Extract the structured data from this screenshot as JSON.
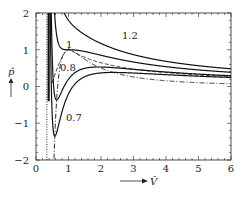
{
  "chart_data": {
    "type": "line",
    "title": "",
    "xlabel": "V̂",
    "ylabel": "p̂",
    "xlim": [
      0,
      6
    ],
    "ylim": [
      -2,
      2
    ],
    "xticks": [
      0,
      1,
      2,
      3,
      4,
      5,
      6
    ],
    "yticks": [
      -2,
      -1,
      0,
      1,
      2
    ],
    "grid": false,
    "legend": "none (inline curve labels)",
    "series": [
      {
        "name": "1.2",
        "style": "solid",
        "kind": "isotherm",
        "T": 1.2,
        "x": [
          0.45,
          0.5,
          0.6,
          0.8,
          1.0,
          1.5,
          2.0,
          3.0,
          4.0,
          5.0,
          6.0
        ],
        "y": [
          5.5,
          3.6,
          2.06,
          1.46,
          1.05,
          0.95,
          0.63,
          0.58,
          0.49,
          0.43,
          0.45
        ]
      },
      {
        "name": "1",
        "style": "solid",
        "kind": "isotherm",
        "T": 1.0,
        "x": [
          0.5,
          0.6,
          0.8,
          1.0,
          1.5,
          2.0,
          3.0,
          4.0,
          5.0,
          6.0
        ],
        "y": [
          4.0,
          1.85,
          1.01,
          1.0,
          0.9,
          0.85,
          0.66,
          0.54,
          0.46,
          0.37
        ]
      },
      {
        "name": "0.8",
        "style": "solid",
        "kind": "isotherm",
        "T": 0.8,
        "x": [
          0.45,
          0.5,
          0.6,
          0.8,
          1.0,
          1.5,
          2.0,
          3.0,
          4.0,
          5.0,
          6.0
        ],
        "y": [
          1.2,
          0.27,
          -0.33,
          0.33,
          0.55,
          0.6,
          0.53,
          0.43,
          0.34,
          0.29,
          0.24
        ]
      },
      {
        "name": "0.7",
        "style": "solid",
        "kind": "isotherm",
        "T": 0.7,
        "x": [
          0.45,
          0.5,
          0.55,
          0.6,
          0.8,
          1.0,
          1.5,
          2.0,
          3.0,
          4.0,
          5.0,
          6.0
        ],
        "y": [
          0.6,
          -0.8,
          -1.3,
          -1.1,
          0.08,
          0.35,
          0.46,
          0.45,
          0.38,
          0.31,
          0.26,
          0.22
        ]
      },
      {
        "name": "spinodal",
        "style": "dash-dot",
        "kind": "spinodal",
        "x": [
          0.55,
          0.6,
          0.7,
          0.8,
          1.0
        ],
        "y": [
          -1.5,
          -0.8,
          0.3,
          0.7,
          1.0
        ]
      },
      {
        "name": "dashed",
        "style": "dashed",
        "kind": "coexistence",
        "x": [
          0.5,
          0.6,
          0.8,
          1.0,
          1.5,
          2.0,
          3.0,
          4.0,
          5.0,
          6.0
        ],
        "y": [
          0.3,
          0.6,
          0.85,
          1.0,
          0.75,
          0.62,
          0.48,
          0.4,
          0.34,
          0.29
        ]
      },
      {
        "name": "dash-dot-right",
        "style": "dash-dot",
        "kind": "asymptote",
        "x": [
          1.0,
          1.5,
          2.0,
          3.0,
          4.0,
          5.0,
          6.0
        ],
        "y": [
          1.0,
          0.55,
          0.4,
          0.25,
          0.18,
          0.13,
          0.1
        ]
      },
      {
        "name": "V=1/3 asymptote",
        "style": "dotted",
        "kind": "asymptote",
        "x": [
          0.333,
          0.333
        ],
        "y": [
          -2,
          2
        ]
      }
    ],
    "annotations": [
      {
        "text": "1.2",
        "x": 1.9,
        "y": 1.4
      },
      {
        "text": "1",
        "x": 1.0,
        "y": 1.13
      },
      {
        "text": "0.8",
        "x": 0.95,
        "y": 0.7
      },
      {
        "text": "0.7",
        "x": 1.0,
        "y": -0.9
      }
    ]
  },
  "axes": {
    "x_tick_labels": [
      "0",
      "1",
      "2",
      "3",
      "4",
      "5",
      "6"
    ],
    "y_tick_labels": [
      "2",
      "1",
      "0",
      "−1",
      "−2"
    ],
    "x_label": "V̂",
    "y_label": "p̂",
    "x_arrow": "→",
    "y_arrow": "↑"
  },
  "labels": {
    "t12": "1.2",
    "t1": "1",
    "t08": "0.8",
    "t07": "0.7"
  }
}
